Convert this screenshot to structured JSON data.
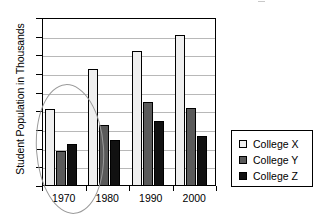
{
  "chart_data": {
    "type": "bar",
    "title": "",
    "subtitle": "",
    "xlabel": "",
    "ylabel": "Student Population in Thousands",
    "categories": [
      "1970",
      "1980",
      "1990",
      "2000"
    ],
    "series": [
      {
        "name": "College X",
        "color": "#efefef",
        "values": [
          20.5,
          31.3,
          36.2,
          40.5
        ]
      },
      {
        "name": "College Y",
        "color": "#5a5a5a",
        "values": [
          9.3,
          16.4,
          22.6,
          21.0
        ]
      },
      {
        "name": "College Z",
        "color": "#111111",
        "values": [
          11.3,
          12.4,
          17.4,
          13.3
        ]
      }
    ],
    "ylim": [
      0,
      45
    ],
    "ytick_values": [
      45,
      40,
      35,
      30,
      25,
      20,
      15,
      10,
      5,
      0
    ],
    "ytick_step": 5,
    "grid": true,
    "grid_color": "#b8b8b8",
    "legend_position": "right",
    "annotations": [
      {
        "type": "ellipse",
        "target": "1970",
        "color": "#9a9a9a",
        "label": ""
      }
    ]
  },
  "legend": {
    "entries": [
      {
        "label": "College X",
        "swatch": "legend-swatch-college-x"
      },
      {
        "label": "College Y",
        "swatch": "legend-swatch-college-y"
      },
      {
        "label": "College Z",
        "swatch": "legend-swatch-college-z"
      }
    ]
  }
}
